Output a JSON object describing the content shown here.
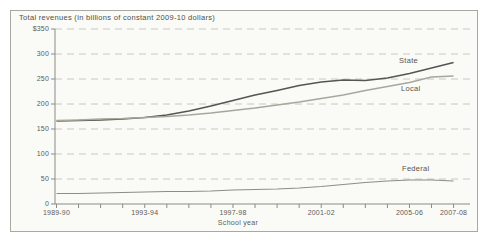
{
  "figure": {
    "title": "Total revenues (in billions of constant 2009-10 dollars)",
    "x_axis_title": "School year"
  },
  "chart_data": {
    "type": "line",
    "title": "Total revenues (in billions of constant 2009-10 dollars)",
    "xlabel": "School year",
    "ylabel": "Total revenues (in billions of constant 2009-10 dollars)",
    "ylim": [
      0,
      350
    ],
    "grid": "horizontal-dashed",
    "legend_position": "inline-right-of-lines",
    "y_ticks": [
      {
        "label": "$350",
        "value": 350
      },
      {
        "label": "300",
        "value": 300
      },
      {
        "label": "250",
        "value": 250
      },
      {
        "label": "200",
        "value": 200
      },
      {
        "label": "150",
        "value": 150
      },
      {
        "label": "100",
        "value": 100
      },
      {
        "label": "50",
        "value": 50
      },
      {
        "label": "0",
        "value": 0
      }
    ],
    "categories": [
      "1989-90",
      "1990-91",
      "1991-92",
      "1992-93",
      "1993-94",
      "1994-95",
      "1995-96",
      "1996-97",
      "1997-98",
      "1998-99",
      "1999-2000",
      "2000-01",
      "2001-02",
      "2002-03",
      "2003-04",
      "2004-05",
      "2005-06",
      "2006-07",
      "2007-08"
    ],
    "labeled_categories": [
      "1989-90",
      "1993-94",
      "1997-98",
      "2001-02",
      "2005-06",
      "2007-08"
    ],
    "series": [
      {
        "name": "State",
        "color": "#565650",
        "width": 1.6,
        "values": [
          166,
          167,
          168,
          170,
          173,
          178,
          186,
          196,
          207,
          218,
          227,
          237,
          244,
          248,
          247,
          252,
          261,
          272,
          283
        ]
      },
      {
        "name": "Local",
        "color": "#a9a69c",
        "width": 1.3,
        "values": [
          167,
          168,
          170,
          171,
          173,
          175,
          178,
          182,
          187,
          192,
          198,
          204,
          211,
          218,
          227,
          235,
          243,
          254,
          256
        ]
      },
      {
        "name": "Federal",
        "color": "#8e8c84",
        "width": 1.1,
        "values": [
          21,
          21,
          22,
          23,
          24,
          25,
          25,
          26,
          28,
          29,
          30,
          32,
          35,
          39,
          43,
          46,
          48,
          48,
          46
        ]
      }
    ]
  },
  "colors": {
    "box_border": "#a9a9a4",
    "box_background": "#fafaf7",
    "gridline": "#c8c8c2",
    "axis": "#8b8b85",
    "text": "#5c5c57"
  }
}
